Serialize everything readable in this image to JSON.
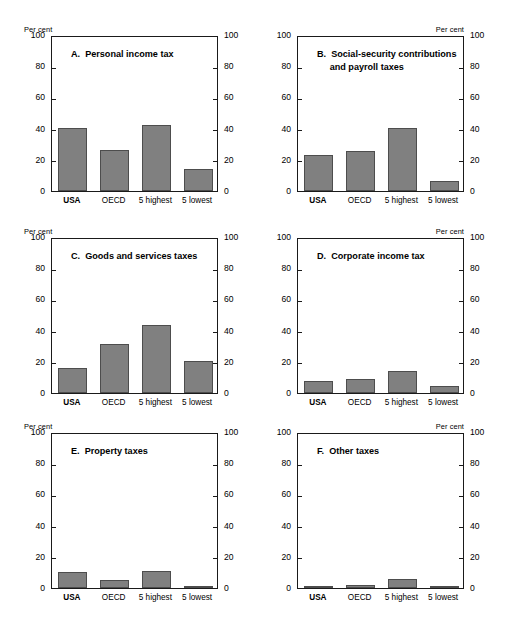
{
  "figure": {
    "axis_caption": "Per cent",
    "y_ticks": [
      0,
      20,
      40,
      60,
      80,
      100
    ],
    "ylim": [
      0,
      100
    ],
    "categories": [
      "USA",
      "OECD",
      "5 highest",
      "5 lowest"
    ],
    "bar_color": "#808080",
    "bar_edge_color": "#4d4d4d",
    "frame_color": "#1a1a1a"
  },
  "chart_data": [
    {
      "type": "bar",
      "panel": "A",
      "title": "A.  Personal income tax",
      "title_lines": [
        "A.  Personal income tax"
      ],
      "categories": [
        "USA",
        "OECD",
        "5 highest",
        "5 lowest"
      ],
      "values": [
        40.5,
        26.0,
        42.5,
        14.0
      ],
      "xlabel": "",
      "ylabel": "Per cent",
      "ylim": [
        0,
        100
      ],
      "yticks": [
        0,
        20,
        40,
        60,
        80,
        100
      ],
      "grid": false,
      "legend": "none"
    },
    {
      "type": "bar",
      "panel": "B",
      "title": "B.  Social-security contributions and payroll taxes",
      "title_lines": [
        "B.  Social-security contributions",
        "     and payroll taxes"
      ],
      "categories": [
        "USA",
        "OECD",
        "5 highest",
        "5 lowest"
      ],
      "values": [
        23.3,
        25.5,
        40.5,
        6.3
      ],
      "xlabel": "",
      "ylabel": "Per cent",
      "ylim": [
        0,
        100
      ],
      "yticks": [
        0,
        20,
        40,
        60,
        80,
        100
      ],
      "grid": false,
      "legend": "none"
    },
    {
      "type": "bar",
      "panel": "C",
      "title": "C.  Goods and services taxes",
      "title_lines": [
        "C.  Goods and services taxes"
      ],
      "categories": [
        "USA",
        "OECD",
        "5 highest",
        "5 lowest"
      ],
      "values": [
        16.0,
        31.3,
        43.5,
        20.3
      ],
      "xlabel": "",
      "ylabel": "Per cent",
      "ylim": [
        0,
        100
      ],
      "yticks": [
        0,
        20,
        40,
        60,
        80,
        100
      ],
      "grid": false,
      "legend": "none"
    },
    {
      "type": "bar",
      "panel": "D",
      "title": "D.  Corporate income tax",
      "title_lines": [
        "D.  Corporate income tax"
      ],
      "categories": [
        "USA",
        "OECD",
        "5 highest",
        "5 lowest"
      ],
      "values": [
        8.0,
        8.7,
        14.0,
        4.7
      ],
      "xlabel": "",
      "ylabel": "Per cent",
      "ylim": [
        0,
        100
      ],
      "yticks": [
        0,
        20,
        40,
        60,
        80,
        100
      ],
      "grid": false,
      "legend": "none"
    },
    {
      "type": "bar",
      "panel": "E",
      "title": "E.  Property taxes",
      "title_lines": [
        "E.  Property taxes"
      ],
      "categories": [
        "USA",
        "OECD",
        "5 highest",
        "5 lowest"
      ],
      "values": [
        10.5,
        5.0,
        11.0,
        1.6
      ],
      "xlabel": "",
      "ylabel": "Per cent",
      "ylim": [
        0,
        100
      ],
      "yticks": [
        0,
        20,
        40,
        60,
        80,
        100
      ],
      "grid": false,
      "legend": "none"
    },
    {
      "type": "bar",
      "panel": "F",
      "title": "F.  Other taxes",
      "title_lines": [
        "F.  Other taxes"
      ],
      "categories": [
        "USA",
        "OECD",
        "5 highest",
        "5 lowest"
      ],
      "values": [
        0.3,
        1.8,
        5.5,
        0.2
      ],
      "xlabel": "",
      "ylabel": "Per cent",
      "ylim": [
        0,
        100
      ],
      "yticks": [
        0,
        20,
        40,
        60,
        80,
        100
      ],
      "grid": false,
      "legend": "none"
    }
  ]
}
